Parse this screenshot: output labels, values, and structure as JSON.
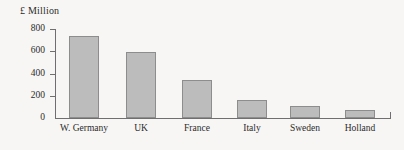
{
  "chart_data": {
    "type": "bar",
    "title": "",
    "unit_label": "£ Million",
    "xlabel": "",
    "ylabel": "£ Million",
    "categories": [
      "W. Germany",
      "UK",
      "France",
      "Italy",
      "Sweden",
      "Holland"
    ],
    "values": [
      735,
      590,
      340,
      165,
      105,
      75
    ],
    "ylim": [
      0,
      800
    ],
    "ytick_labels": [
      "800",
      "600",
      "400",
      "200",
      "0"
    ],
    "ytick_values": [
      800,
      600,
      400,
      200,
      0
    ],
    "grid": false,
    "legend": null,
    "series": [
      {
        "name": "£ Million",
        "values": [
          735,
          590,
          340,
          165,
          105,
          75
        ]
      }
    ],
    "colors": {
      "bar_fill": "#bcbcbc",
      "bar_stroke": "#8d8d8d",
      "axis": "#6f6f6f",
      "text": "#2b2b2b",
      "background": "#f7f6f4"
    }
  },
  "geometry": {
    "baseline_y": 118,
    "top_y": 29,
    "axis_left_x": 55,
    "axis_right_x": 391,
    "value_per_pixel": 8.98,
    "bar_slots": [
      {
        "center_x": 84,
        "width": 30
      },
      {
        "center_x": 141,
        "width": 30
      },
      {
        "center_x": 197,
        "width": 30
      },
      {
        "center_x": 252,
        "width": 30
      },
      {
        "center_x": 305,
        "width": 30
      },
      {
        "center_x": 360,
        "width": 30
      }
    ]
  }
}
